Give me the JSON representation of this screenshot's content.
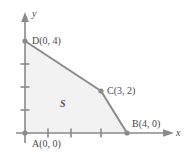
{
  "figure": {
    "type": "coordinate-diagram",
    "width": 187,
    "height": 163,
    "background_color": "#ffffff",
    "axes": {
      "x_label": "x",
      "y_label": "y",
      "axis_color": "#8a8a8a",
      "origin_px": [
        25,
        133
      ],
      "unit_px": 23,
      "x_ticks": [
        1,
        2,
        3
      ],
      "y_ticks": [
        1,
        2,
        3
      ],
      "x_arrow_end_px": 172,
      "y_arrow_end_px": 14
    },
    "region": {
      "label": "S",
      "fill_color": "#f2f2f2",
      "edge_color": "#8a8a8a",
      "vertices": [
        {
          "name": "A",
          "label": "A(0, 0)",
          "x": 0,
          "y": 0,
          "px": [
            25,
            133
          ]
        },
        {
          "name": "B",
          "label": "B(4, 0)",
          "x": 4,
          "y": 0,
          "px": [
            127,
            133
          ]
        },
        {
          "name": "C",
          "label": "C(3, 2)",
          "x": 3,
          "y": 2,
          "px": [
            101,
            91
          ]
        },
        {
          "name": "D",
          "label": "D(0, 4)",
          "x": 0,
          "y": 4,
          "px": [
            25,
            41
          ]
        }
      ]
    },
    "vertex_dot_color": "#8a8a8a",
    "text_color": "#4a4a4a"
  }
}
